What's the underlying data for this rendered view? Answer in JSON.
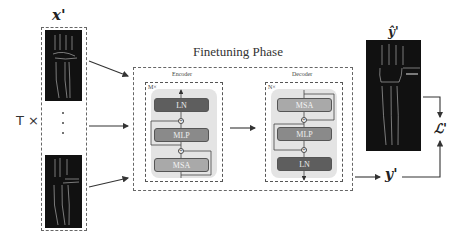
{
  "inputs": {
    "label": "x'",
    "repeat_label": "T ×",
    "ellipsis": "·\n·\n·"
  },
  "main": {
    "title": "Finetuning Phase",
    "encoder": {
      "label": "Encoder",
      "repeat": "M×",
      "blocks": [
        "LN",
        "MLP",
        "MSA"
      ]
    },
    "decoder": {
      "label": "Decoder",
      "repeat": "N×",
      "blocks": [
        "MSA",
        "MLP",
        "LN"
      ]
    }
  },
  "outputs": {
    "prediction_label": "ŷ'",
    "target_label": "y'",
    "loss_label": "ℒ'"
  },
  "colors": {
    "ln": "#5e5e5e",
    "mlp": "#8a8a8a",
    "msa": "#a9a9a9",
    "panel": "#e4e4e4",
    "image_bg": "#111111"
  }
}
